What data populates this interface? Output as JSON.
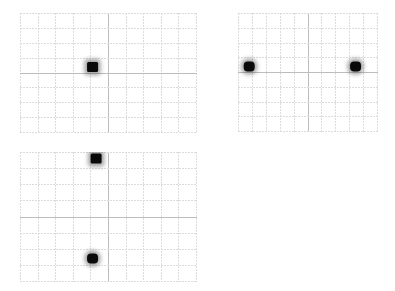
{
  "figure": {
    "colors": {
      "background": "#ffffff",
      "grid_minor": "#dcdcdc",
      "grid_major": "#bdbdbd",
      "spot": "#0a0a0a"
    },
    "panels": [
      {
        "id": "panel-a",
        "grid": {
          "cols": 10,
          "rows": 8
        },
        "spots": [
          {
            "x": 0.41,
            "y": 0.45,
            "size": "large",
            "shape": "square"
          }
        ]
      },
      {
        "id": "panel-b",
        "grid": {
          "cols": 10,
          "rows": 8
        },
        "spots": [
          {
            "x": 0.08,
            "y": 0.45,
            "size": "large",
            "shape": "round"
          },
          {
            "x": 0.84,
            "y": 0.45,
            "size": "large",
            "shape": "round"
          }
        ]
      },
      {
        "id": "panel-c",
        "grid": {
          "cols": 10,
          "rows": 8
        },
        "spots": [
          {
            "x": 0.43,
            "y": 0.05,
            "size": "large",
            "shape": "square"
          },
          {
            "x": 0.41,
            "y": 0.82,
            "size": "large",
            "shape": "round"
          }
        ]
      }
    ]
  }
}
